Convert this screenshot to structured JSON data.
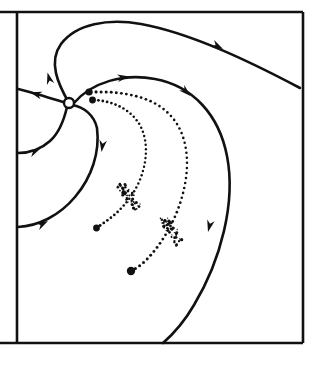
{
  "figure": {
    "width": 320,
    "height": 366,
    "background_color": "#ffffff",
    "ink_color": "#111111"
  },
  "frame": {
    "name": "plot-border",
    "top_y": 12,
    "bottom_y": 343,
    "left_x": 17,
    "right_x": 303,
    "outer_top_left_x": 0,
    "outer_bottom_left_x": 0,
    "stroke_width": 2.6,
    "note": "rectangular border; top and bottom rules extend left beyond the left vertical rule to x=0"
  },
  "singular_point": {
    "name": "equilibrium-node",
    "x": 69,
    "y": 103,
    "radius": 5.0,
    "style": "open-circle",
    "fill": "#ffffff",
    "stroke": "#111111"
  },
  "flow_curves": [
    {
      "id": "separatrix-upper-outgoing",
      "label": "upper separatrix sweeping up and right to frame edge",
      "direction": "outward",
      "path": "M 69 103 C 58 84 48 62 61 44 C 76 24 108 18 141 24 C 190 33 247 60 300 88",
      "arrows": [
        {
          "x": 47.5,
          "y": 72.5,
          "angle": 255,
          "label": "arrow-up-left-outflow"
        },
        {
          "x": 223,
          "y": 49,
          "angle": 28,
          "label": "arrow-right-outflow"
        }
      ]
    },
    {
      "id": "separatrix-left-outgoing",
      "label": "short left branch exiting to the left border",
      "direction": "outward",
      "path": "M 66 103 C 56 100 44 96 33 93 C 27 91 22 90 18 89",
      "arrows": [
        {
          "x": 30,
          "y": 92.2,
          "angle": 196,
          "label": "arrow-left-outflow"
        }
      ]
    },
    {
      "id": "separatrix-lower-left-incoming",
      "label": "lower-left branch flowing in toward the node",
      "direction": "inward",
      "path": "M 18 153 C 28 153 40 150 50 141 C 59 133 64 120 67 107",
      "arrows": [
        {
          "x": 40.5,
          "y": 148.5,
          "angle": 335,
          "label": "arrow-inflow-lower-left"
        }
      ]
    },
    {
      "id": "separatrix-big-left-incoming",
      "label": "long outer left branch flowing in from the lower-left border",
      "direction": "inward",
      "path": "M 18 227 C 38 226 59 216 75 197 C 92 177 100 152 97 128 C 94 115 84 107 72 105",
      "arrows": [
        {
          "x": 48,
          "y": 221,
          "angle": 332,
          "label": "arrow-inflow-outer-left"
        },
        {
          "x": 101.5,
          "y": 152,
          "angle": 98,
          "label": "arrow-inflow-descending"
        }
      ]
    },
    {
      "id": "separatrix-outer-right",
      "label": "outer right separatrix from node sweeping right and down to bottom border",
      "direction": "outward",
      "path": "M 74 103 C 92 82 124 73 155 79 C 193 86 219 115 227 156 C 236 202 221 260 194 305 C 183 324 171 336 163 343",
      "arrows": [
        {
          "x": 129.5,
          "y": 76.5,
          "angle": 352,
          "label": "arrow-right-top-outflow"
        },
        {
          "x": 190.5,
          "y": 96,
          "angle": 43,
          "label": "arrow-right-descending"
        },
        {
          "x": 208,
          "y": 232,
          "angle": 104,
          "label": "arrow-right-bottom-outflow"
        }
      ]
    }
  ],
  "dotted_trajectories": [
    {
      "id": "dotted-trajectory-inner",
      "label": "inner dotted trajectory from upper filled dot to lower-left filled dot",
      "start_dot": {
        "x": 92.5,
        "y": 100.0,
        "radius": 3.4,
        "name": "inner-start-dot"
      },
      "end_dot": {
        "x": 96.5,
        "y": 228.0,
        "radius": 3.4,
        "name": "inner-end-dot"
      },
      "path": "M 94 100 C 112 101 128 108 138 122 C 148 137 148 158 141 177 C 134 196 120 212 105 222 C 101 225 98 227 96.5 228",
      "dot_radius": 1.45,
      "dot_count": 40,
      "cluster": {
        "name": "inner-dot-cluster",
        "x": 129,
        "y": 196,
        "angle_deg": 52,
        "length": 30,
        "width": 11,
        "dot_count": 46
      }
    },
    {
      "id": "dotted-trajectory-outer",
      "label": "outer dotted trajectory from upper filled dot to lower filled dot",
      "start_dot": {
        "x": 89.0,
        "y": 92.0,
        "radius": 3.6,
        "name": "outer-start-dot"
      },
      "end_dot": {
        "x": 131.0,
        "y": 271.0,
        "radius": 4.2,
        "name": "outer-end-dot"
      },
      "path": "M 91 92 C 124 91 152 97 168 113 C 186 130 190 157 185 184 C 180 212 166 238 150 256 C 142 265 135 269 131 271",
      "dot_radius": 1.55,
      "dot_count": 52,
      "cluster": {
        "name": "outer-dot-cluster",
        "x": 171,
        "y": 230,
        "angle_deg": 58,
        "length": 32,
        "width": 12,
        "dot_count": 50
      }
    }
  ]
}
